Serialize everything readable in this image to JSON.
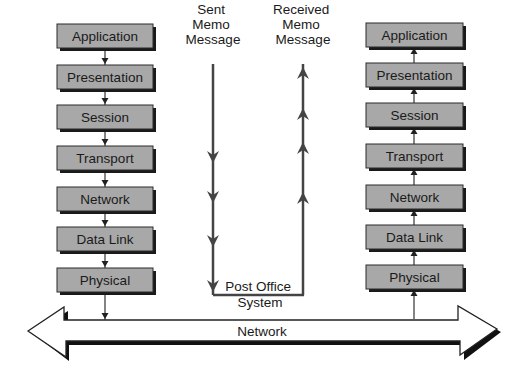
{
  "colors": {
    "box_fill": "#a8a8a8",
    "box_border": "#2a2a2a",
    "box_shadow": "#1a1a1a",
    "line": "#444444",
    "thin_line": "#333333",
    "text": "#1a1a1a",
    "background": "#ffffff"
  },
  "left_stack": {
    "x": 57,
    "width": 96,
    "height": 24,
    "direction": "down",
    "connector_x": 105,
    "layers": [
      {
        "label": "Application",
        "y": 24
      },
      {
        "label": "Presentation",
        "y": 65
      },
      {
        "label": "Session",
        "y": 105
      },
      {
        "label": "Transport",
        "y": 146
      },
      {
        "label": "Network",
        "y": 187
      },
      {
        "label": "Data Link",
        "y": 227
      },
      {
        "label": "Physical",
        "y": 268
      }
    ],
    "to_network_y": 320
  },
  "right_stack": {
    "x": 366,
    "width": 97,
    "height": 24,
    "direction": "up",
    "connector_x": 414,
    "layers": [
      {
        "label": "Application",
        "y": 23
      },
      {
        "label": "Presentation",
        "y": 63
      },
      {
        "label": "Session",
        "y": 103
      },
      {
        "label": "Transport",
        "y": 144
      },
      {
        "label": "Network",
        "y": 185
      },
      {
        "label": "Data Link",
        "y": 225
      },
      {
        "label": "Physical",
        "y": 265
      }
    ],
    "from_network_y": 319
  },
  "sent_memo": {
    "lines": [
      "Sent",
      "Memo",
      "Message"
    ],
    "x": 213,
    "y_top": 64,
    "y_bottom": 295,
    "arrow_ys": [
      163,
      203,
      247,
      292
    ]
  },
  "received_memo": {
    "lines": [
      "Received",
      "Memo",
      "Message"
    ],
    "x": 303,
    "y_top": 64,
    "y_bottom": 295,
    "arrow_ys": [
      67,
      108,
      142,
      192
    ]
  },
  "post_office": {
    "lines": [
      "Post Office",
      "System"
    ]
  },
  "network_arrow": {
    "label": "Network",
    "shaft_top": 320,
    "shaft_bottom": 341,
    "left_tip_x": 28,
    "left_head_x": 65,
    "head_top": 307,
    "head_bottom": 356,
    "right_tip_x": 497,
    "right_head_x": 459
  }
}
